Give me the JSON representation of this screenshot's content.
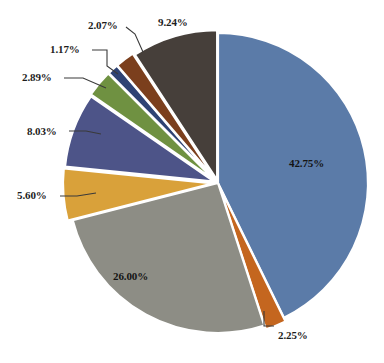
{
  "chart_data": {
    "type": "pie",
    "title": "",
    "subtitle": "",
    "xlabel": "",
    "ylabel": "",
    "legend_position": "none",
    "grid": false,
    "units": "percent",
    "label_format": "0.00%",
    "total": 100.0,
    "start_angle_deg": 0,
    "direction": "clockwise",
    "categories": [
      "Segment 1",
      "Segment 2",
      "Segment 3",
      "Segment 4",
      "Segment 5",
      "Segment 6",
      "Segment 7",
      "Segment 8",
      "Segment 9"
    ],
    "values": [
      42.75,
      2.25,
      26.0,
      5.6,
      8.03,
      2.89,
      1.17,
      2.07,
      9.24
    ],
    "labels": [
      "42.75%",
      "2.25%",
      "26.00%",
      "5.60%",
      "8.03%",
      "2.89%",
      "1.17%",
      "2.07%",
      "9.24%"
    ],
    "colors": [
      "#5b7ba8",
      "#c4661f",
      "#8d8d85",
      "#d9a13a",
      "#4d5488",
      "#6f9141",
      "#2e4374",
      "#7b3f1d",
      "#463f3a"
    ],
    "slices": [
      {
        "label": "42.75%",
        "value": 42.75,
        "color": "#5b7ba8",
        "leader": false,
        "label_placement": "inside"
      },
      {
        "label": "2.25%",
        "value": 2.25,
        "color": "#c4661f",
        "leader": true,
        "label_placement": "outside"
      },
      {
        "label": "26.00%",
        "value": 26.0,
        "color": "#8d8d85",
        "leader": false,
        "label_placement": "inside"
      },
      {
        "label": "5.60%",
        "value": 5.6,
        "color": "#d9a13a",
        "leader": true,
        "label_placement": "outside"
      },
      {
        "label": "8.03%",
        "value": 8.03,
        "color": "#4d5488",
        "leader": true,
        "label_placement": "outside"
      },
      {
        "label": "2.89%",
        "value": 2.89,
        "color": "#6f9141",
        "leader": true,
        "label_placement": "outside"
      },
      {
        "label": "1.17%",
        "value": 1.17,
        "color": "#2e4374",
        "leader": true,
        "label_placement": "outside"
      },
      {
        "label": "2.07%",
        "value": 2.07,
        "color": "#7b3f1d",
        "leader": true,
        "label_placement": "outside"
      },
      {
        "label": "9.24%",
        "value": 9.24,
        "color": "#463f3a",
        "leader": false,
        "label_placement": "outside"
      }
    ]
  },
  "figure": {
    "background": "#ffffff",
    "slice_border_color": "#ffffff",
    "label_color": "#1d1d1d"
  }
}
